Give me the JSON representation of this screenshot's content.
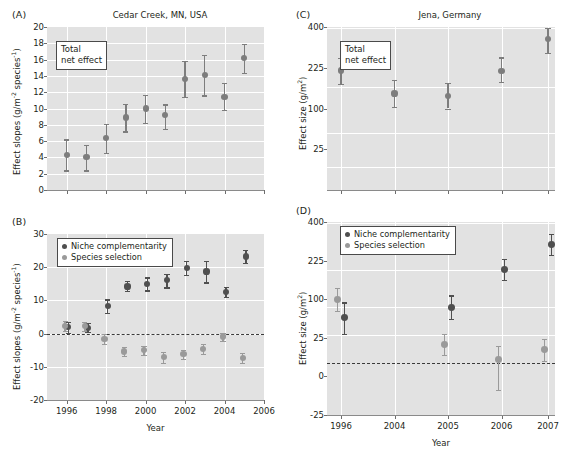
{
  "figure": {
    "panels": [
      "A",
      "B",
      "C",
      "D"
    ],
    "marker_colors": {
      "niche_complementarity": "#4f4f4f",
      "species_selection": "#9a9a9a",
      "total_net_effect": "#7d7d7d"
    },
    "plot_background": "#e2e2e2",
    "gridline_color": "#ffffff"
  },
  "panelA": {
    "letter": "(A)",
    "title": "Cedar Creek, MN, USA",
    "annotation_line1": "Total",
    "annotation_line2": "net effect",
    "ylabel_text": "Effect slopes (g/m",
    "ylabel_sup1": "-2",
    "ylabel_mid": " species",
    "ylabel_sup2": "-1",
    "ylabel_end": ")",
    "chart_data": {
      "type": "scatter",
      "title": "Cedar Creek, MN, USA",
      "xlabel": "",
      "ylabel": "Effect slopes (g/m-2 species-1)",
      "ylim": [
        0,
        20
      ],
      "yticks": [
        0,
        2,
        4,
        6,
        8,
        10,
        12,
        14,
        16,
        18,
        20
      ],
      "xlim": [
        1995,
        2006
      ],
      "xticks": [
        1996,
        1998,
        2000,
        2002,
        2004,
        2006
      ],
      "grid": true,
      "legend": "Total net effect",
      "series": [
        {
          "name": "Total net effect",
          "color": "#7d7d7d",
          "x": [
            1996,
            1997,
            1998,
            1999,
            2000,
            2001,
            2002,
            2003,
            2004,
            2005
          ],
          "values": [
            4.25,
            4.0,
            6.4,
            8.9,
            10.0,
            9.2,
            13.65,
            14.1,
            11.45,
            16.2
          ],
          "err_low": [
            2.4,
            2.4,
            4.6,
            7.2,
            8.2,
            7.5,
            11.4,
            11.6,
            9.8,
            14.4
          ],
          "err_high": [
            6.2,
            5.5,
            8.1,
            10.6,
            11.7,
            10.5,
            15.8,
            16.6,
            13.1,
            17.9
          ]
        }
      ]
    }
  },
  "panelB": {
    "letter": "(B)",
    "legend_niche": "Niche complementarity",
    "legend_species": "Species selection",
    "ylabel_text": "Effect slopes (g/m",
    "ylabel_sup1": "-2",
    "ylabel_mid": " species",
    "ylabel_sup2": "-1",
    "ylabel_end": ")",
    "xlabel": "Year",
    "chart_data": {
      "type": "scatter",
      "title": "",
      "xlabel": "Year",
      "ylabel": "Effect slopes (g/m-2 species-1)",
      "ylim": [
        -20,
        30
      ],
      "yticks": [
        -20,
        -10,
        0,
        10,
        20,
        30
      ],
      "xlim": [
        1995,
        2006
      ],
      "xticks": [
        1996,
        1998,
        2000,
        2002,
        2004,
        2006
      ],
      "grid": true,
      "zero_reference_line": 0,
      "legend_position": "upper-left",
      "series": [
        {
          "name": "Niche complementarity",
          "color": "#4f4f4f",
          "x": [
            1996,
            1997,
            1998,
            1999,
            2000,
            2001,
            2002,
            2003,
            2004,
            2005
          ],
          "values": [
            1.9,
            1.8,
            8.3,
            14.2,
            14.9,
            16.1,
            19.8,
            18.7,
            12.5,
            23.2
          ],
          "err_low": [
            0.3,
            0.5,
            6.3,
            12.8,
            13.0,
            13.9,
            17.6,
            15.4,
            11.0,
            21.3
          ],
          "err_high": [
            3.6,
            3.2,
            10.3,
            15.8,
            16.9,
            18.1,
            21.9,
            22.0,
            14.0,
            25.2
          ]
        },
        {
          "name": "Species selection",
          "color": "#9a9a9a",
          "x": [
            1996,
            1997,
            1998,
            1999,
            2000,
            2001,
            2002,
            2003,
            2004,
            2005
          ],
          "values": [
            2.3,
            2.2,
            -1.6,
            -5.4,
            -4.9,
            -7.1,
            -6.2,
            -4.6,
            -0.9,
            -7.3
          ],
          "err_low": [
            0.7,
            0.8,
            -3.0,
            -6.7,
            -6.3,
            -8.8,
            -7.6,
            -6.2,
            -2.2,
            -8.8
          ],
          "err_high": [
            3.9,
            3.5,
            -0.2,
            -4.1,
            -3.6,
            -5.6,
            -4.8,
            -3.2,
            0.3,
            -5.9
          ]
        }
      ]
    }
  },
  "panelC": {
    "letter": "(C)",
    "title": "Jena, Germany",
    "annotation_line1": "Total",
    "annotation_line2": "net effect",
    "ylabel_text": "Effect size (g/m",
    "ylabel_sup": "2",
    "ylabel_end": ")",
    "chart_data": {
      "type": "scatter",
      "title": "Jena, Germany",
      "xlabel": "",
      "ylabel": "Effect size (g/m2)",
      "yscale": "sqrt",
      "ylim": [
        0,
        400
      ],
      "yticks": [
        25,
        100,
        225,
        400
      ],
      "xticks_unlabeled": [
        1996,
        2004,
        2005,
        2006,
        2007
      ],
      "grid": true,
      "legend": "Total net effect",
      "series": [
        {
          "name": "Total net effect",
          "color": "#7d7d7d",
          "x": [
            1996,
            2004,
            2005,
            2006,
            2007
          ],
          "values": [
            215,
            140,
            133,
            214,
            345
          ],
          "err_low": [
            170,
            104,
            100,
            176,
            283
          ],
          "err_high": [
            263,
            183,
            173,
            265,
            395
          ]
        }
      ]
    }
  },
  "panelD": {
    "letter": "(D)",
    "legend_niche": "Niche complementarity",
    "legend_species": "Species selection",
    "ylabel_text": "Effect size (g/m",
    "ylabel_sup": "2",
    "ylabel_end": ")",
    "xlabel": "Year",
    "chart_data": {
      "type": "scatter",
      "title": "",
      "xlabel": "Year",
      "ylabel": "Effect size (g/m2)",
      "yscale": "sqrt",
      "ylim": [
        -25,
        400
      ],
      "yticks": [
        -25,
        0,
        25,
        100,
        225,
        400
      ],
      "xticks": [
        1996,
        2004,
        2005,
        2006,
        2007
      ],
      "grid": true,
      "zero_reference_line": 0,
      "legend_position": "upper-left",
      "series": [
        {
          "name": "Niche complementarity",
          "color": "#4f4f4f",
          "x": [
            1996,
            2005,
            2006,
            2007
          ],
          "values": [
            58,
            80,
            193,
            292
          ],
          "err_low": [
            30,
            55,
            155,
            248
          ],
          "err_high": [
            92,
            110,
            233,
            340
          ]
        },
        {
          "name": "Species selection",
          "color": "#9a9a9a",
          "x": [
            1996,
            2005,
            2006,
            2007
          ],
          "values": [
            100,
            17,
            5,
            12
          ],
          "err_low": [
            72,
            8,
            -3,
            4
          ],
          "err_high": [
            132,
            30,
            16,
            24
          ]
        }
      ]
    }
  }
}
